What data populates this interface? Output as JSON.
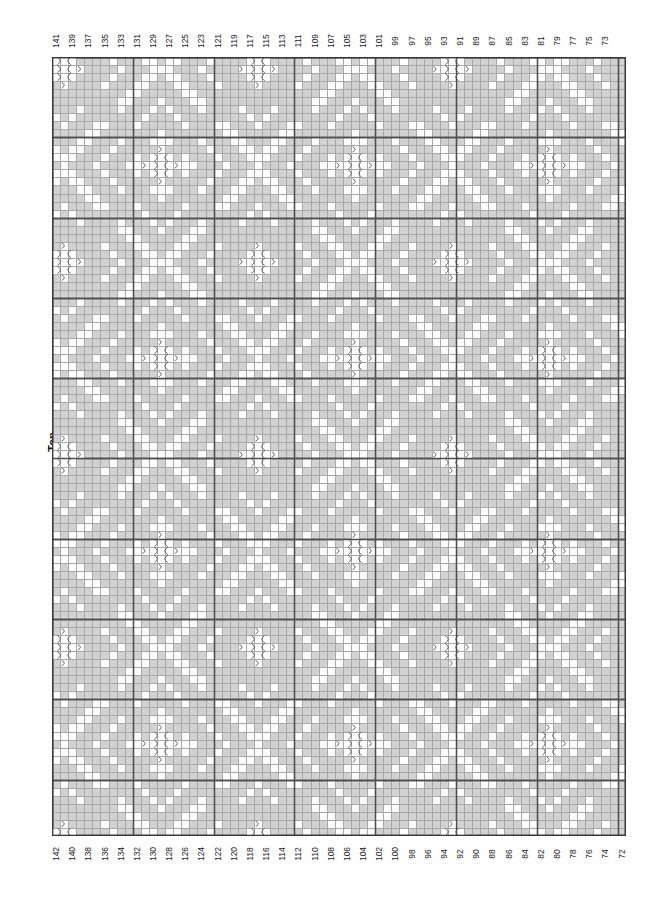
{
  "page": {
    "kind": "filet-crochet-chart",
    "background": "#ffffff"
  },
  "side_caption": {
    "label": "Top",
    "orientation": "vertical-rotated-90"
  },
  "grid": {
    "columns": 71,
    "rows": 97,
    "cell_width": 8.08,
    "cell_height": 8.03,
    "origin_x": 52,
    "origin_y": 57,
    "heavy_line_every": 10,
    "colors": {
      "filled": "#d2d2d2",
      "empty": "#ffffff",
      "thin_line": "#a8a8a8",
      "heavy_line": "#4d4d4d",
      "border": "#3a3a3a",
      "symbol": "#555555"
    }
  },
  "column_labels": {
    "top": [
      141,
      139,
      137,
      135,
      133,
      131,
      129,
      127,
      125,
      123,
      121,
      119,
      117,
      115,
      113,
      111,
      109,
      107,
      105,
      103,
      101,
      99,
      97,
      95,
      93,
      91,
      89,
      87,
      85,
      83,
      81,
      79,
      77,
      75,
      73
    ],
    "bottom": [
      142,
      140,
      138,
      136,
      134,
      132,
      130,
      128,
      126,
      124,
      122,
      120,
      118,
      116,
      114,
      112,
      110,
      108,
      106,
      104,
      102,
      100,
      98,
      96,
      94,
      92,
      90,
      88,
      86,
      84,
      82,
      80,
      78,
      76,
      74,
      72
    ],
    "direction": "descending-left-to-right",
    "top_parity": "odd",
    "bottom_parity": "even"
  },
  "chart_data": {
    "type": "heatmap",
    "title": "",
    "xlabel": "",
    "ylabel": "",
    "legend": [
      {
        "symbol": "filled-block",
        "meaning": "filled mesh square",
        "color": "#d2d2d2"
      },
      {
        "symbol": "empty-block",
        "meaning": "open mesh square",
        "color": "#ffffff"
      },
      {
        "symbol": "arc-glyph",
        "meaning": "special stitch marker",
        "color": "#555555"
      }
    ],
    "motif": {
      "description": "repeating diamond / eight-point star lattice",
      "tile_cols": 24,
      "tile_rows": 24,
      "symbol_cluster_cols": 4,
      "symbol_cluster_rows": 5
    },
    "pattern_seed": {
      "diamond_half": 11,
      "inner_ring": 7,
      "center_open": 3,
      "lattice_offset_x": 11,
      "lattice_offset_y": 11
    }
  }
}
